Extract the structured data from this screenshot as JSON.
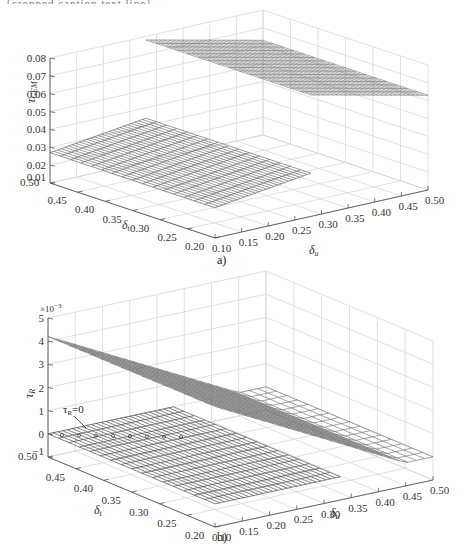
{
  "page": {
    "top_text": "（cropped caption text line）"
  },
  "chart_data": [
    {
      "id": "a",
      "type": "surface3d",
      "caption": "a)",
      "title": "",
      "xlabel": "δu",
      "ylabel": "δt",
      "zlabel": "τGEM",
      "x_ticks": [
        "0.10",
        "0.15",
        "0.20",
        "0.25",
        "0.30",
        "0.35",
        "0.40",
        "0.45",
        "0.50"
      ],
      "y_ticks": [
        "0.50",
        "0.45",
        "0.40",
        "0.35",
        "0.30",
        "0.25",
        "0.20"
      ],
      "z_ticks": [
        "0.01",
        "0.02",
        "0.03",
        "0.04",
        "0.05",
        "0.06",
        "0.07",
        "0.08"
      ],
      "xlim": [
        0.1,
        0.5
      ],
      "ylim": [
        0.2,
        0.5
      ],
      "zlim": [
        0.01,
        0.08
      ],
      "grid": true,
      "surfaces": [
        {
          "name": "lower plane",
          "description": "nearly flat, rises slightly with δu",
          "corners": {
            "du0.10_dt0.50": 0.027,
            "du0.10_dt0.20": 0.027,
            "du0.28_dt0.50": 0.034,
            "du0.28_dt0.20": 0.034
          }
        },
        {
          "name": "upper plane",
          "description": "high plateau beyond δu≈0.28, slopes down toward δu=0.50",
          "corners": {
            "du0.28_dt0.50": 0.078,
            "du0.50_dt0.50": 0.063
          }
        }
      ]
    },
    {
      "id": "b",
      "type": "surface3d",
      "caption": "b)",
      "title": "",
      "xlabel": "δu",
      "ylabel": "δt",
      "zlabel": "τR",
      "z_multiplier": "×10⁻³",
      "x_ticks": [
        "0.10",
        "0.15",
        "0.20",
        "0.25",
        "0.30",
        "0.35",
        "0.40",
        "0.45",
        "0.50"
      ],
      "y_ticks": [
        "0.50",
        "0.45",
        "0.40",
        "0.35",
        "0.30",
        "0.25",
        "0.20"
      ],
      "z_ticks": [
        "−1",
        "0",
        "1",
        "2",
        "3",
        "4",
        "5"
      ],
      "xlim": [
        0.1,
        0.5
      ],
      "ylim": [
        0.2,
        0.5
      ],
      "zlim": [
        -1,
        5
      ],
      "grid": true,
      "annotation": {
        "text": "τR=0",
        "target": "zero plane"
      },
      "surfaces": [
        {
          "name": "sloped plane",
          "description": "τR decreases linearly from ≈4.2 at δu=0.10 to ≈0 at δu≈0.45",
          "corners": {
            "du0.10_dt0.50": 4.2,
            "du0.10_dt0.20": 4.2,
            "du0.45_dt0.50": 0.0,
            "du0.45_dt0.20": 0.0
          }
        },
        {
          "name": "zero plane",
          "description": "τR = 0 plane",
          "value": 0
        }
      ]
    }
  ],
  "labels": {
    "a": {
      "zlabel_main": "τ",
      "zlabel_sub": "GEM",
      "ylabel_main": "δ",
      "ylabel_sub": "t",
      "xlabel_main": "δ",
      "xlabel_sub": "u",
      "caption": "a)"
    },
    "b": {
      "zlabel_main": "τ",
      "zlabel_sub": "R",
      "ylabel_main": "δ",
      "ylabel_sub": "t",
      "xlabel_main": "δ",
      "xlabel_sub": "u",
      "caption": "b)",
      "multiplier": "×10",
      "multiplier_exp": "−3",
      "annotation_main": "τ",
      "annotation_sub": "R",
      "annotation_rest": "=0"
    }
  }
}
